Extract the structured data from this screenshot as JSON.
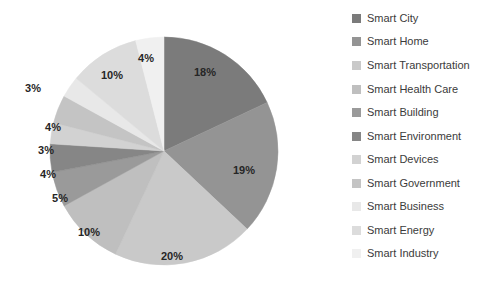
{
  "chart_data": {
    "type": "pie",
    "title": "",
    "subtitle": "",
    "xlabel": "",
    "ylabel": "",
    "legend_position": "right",
    "grid": false,
    "start_angle_deg": 0,
    "direction": "clockwise",
    "categories": [
      "Smart City",
      "Smart Home",
      "Smart Transportation",
      "Smart Health Care",
      "Smart Building",
      "Smart Environment",
      "Smart Devices",
      "Smart Government",
      "Smart Business",
      "Smart Energy",
      "Smart Industry"
    ],
    "values": [
      18,
      19,
      20,
      10,
      5,
      4,
      3,
      4,
      3,
      10,
      4
    ],
    "data_labels": [
      "18%",
      "19%",
      "20%",
      "10%",
      "5%",
      "4%",
      "3%",
      "4%",
      "3%",
      "10%",
      "4%"
    ],
    "colors": [
      "#7b7b7b",
      "#949494",
      "#c9c9c9",
      "#bfbfbf",
      "#9a9a9a",
      "#868686",
      "#d2d2d2",
      "#c4c4c4",
      "#e8e8e8",
      "#dcdcdc",
      "#f0f0f0"
    ],
    "label_color": "#262626",
    "legend_text_color": "#3b3b3b",
    "background": "#ffffff"
  },
  "pie": {
    "center_x": 164,
    "center_y": 151,
    "radius": 114,
    "slices": [
      {
        "label": "18%",
        "value": 18,
        "category": "Smart City",
        "color": "#7b7b7b",
        "label_x": 205,
        "label_y": 72
      },
      {
        "label": "19%",
        "value": 19,
        "category": "Smart Home",
        "color": "#949494",
        "label_x": 244,
        "label_y": 170
      },
      {
        "label": "20%",
        "value": 20,
        "category": "Smart Transportation",
        "color": "#c9c9c9",
        "label_x": 172,
        "label_y": 256
      },
      {
        "label": "10%",
        "value": 10,
        "category": "Smart Health Care",
        "color": "#bfbfbf",
        "label_x": 89,
        "label_y": 232
      },
      {
        "label": "5%",
        "value": 5,
        "category": "Smart Building",
        "color": "#9a9a9a",
        "label_x": 60,
        "label_y": 198
      },
      {
        "label": "4%",
        "value": 4,
        "category": "Smart Environment",
        "color": "#868686",
        "label_x": 48,
        "label_y": 174
      },
      {
        "label": "3%",
        "value": 3,
        "category": "Smart Devices",
        "color": "#d2d2d2",
        "label_x": 46,
        "label_y": 150
      },
      {
        "label": "4%",
        "value": 4,
        "category": "Smart Government",
        "color": "#c4c4c4",
        "label_x": 53,
        "label_y": 127
      },
      {
        "label": "3%",
        "value": 3,
        "category": "Smart Business",
        "color": "#e8e8e8",
        "label_x": 33,
        "label_y": 88
      },
      {
        "label": "10%",
        "value": 10,
        "category": "Smart Energy",
        "color": "#dcdcdc",
        "label_x": 112,
        "label_y": 75
      },
      {
        "label": "4%",
        "value": 4,
        "category": "Smart Industry",
        "color": "#f0f0f0",
        "label_x": 146,
        "label_y": 58
      }
    ]
  },
  "legend": {
    "items": [
      {
        "label": "Smart City",
        "color": "#7b7b7b",
        "y": 11
      },
      {
        "label": "Smart Home",
        "color": "#949494",
        "y": 34
      },
      {
        "label": "Smart Transportation",
        "color": "#c9c9c9",
        "y": 58
      },
      {
        "label": "Smart Health Care",
        "color": "#bfbfbf",
        "y": 82
      },
      {
        "label": "Smart Building",
        "color": "#9a9a9a",
        "y": 105
      },
      {
        "label": "Smart Environment",
        "color": "#868686",
        "y": 129
      },
      {
        "label": "Smart Devices",
        "color": "#d2d2d2",
        "y": 152
      },
      {
        "label": "Smart Government",
        "color": "#c4c4c4",
        "y": 176
      },
      {
        "label": "Smart Business",
        "color": "#e8e8e8",
        "y": 199
      },
      {
        "label": "Smart Energy",
        "color": "#dcdcdc",
        "y": 223
      },
      {
        "label": "Smart Industry",
        "color": "#f0f0f0",
        "y": 246
      }
    ]
  }
}
